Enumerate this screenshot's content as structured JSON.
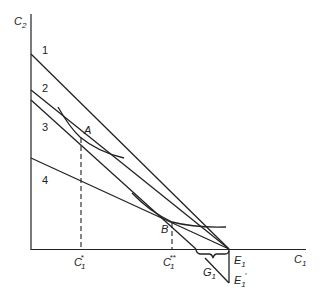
{
  "diagram": {
    "type": "economics-intertemporal-consumption",
    "axes": {
      "y_label": "C",
      "y_label_sub": "2",
      "x_label": "C",
      "x_label_sub": "1"
    },
    "lines": [
      {
        "id": "1",
        "label": "1"
      },
      {
        "id": "2",
        "label": "2"
      },
      {
        "id": "3",
        "label": "3"
      },
      {
        "id": "4",
        "label": "4"
      }
    ],
    "points": {
      "A": {
        "label": "A"
      },
      "B": {
        "label": "B"
      }
    },
    "x_ticks": {
      "c1_star": {
        "base": "C",
        "sub": "1",
        "sup": "*"
      },
      "c1_double_star": {
        "base": "C",
        "sub": "1",
        "sup": "**"
      }
    },
    "endowments": {
      "E1": {
        "base": "E",
        "sub": "1"
      },
      "E1_prime": {
        "base": "E",
        "sub": "1",
        "prime": "′"
      }
    },
    "G1": {
      "base": "G",
      "sub": "1"
    }
  }
}
